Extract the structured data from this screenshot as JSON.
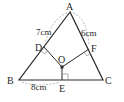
{
  "diagram": {
    "type": "geometry",
    "colors": {
      "line": "#2a2a2a",
      "dash": "#8a8a8a",
      "background": "#ffffff"
    },
    "points": {
      "A": {
        "label": "A",
        "x": 70,
        "y": 12
      },
      "B": {
        "label": "B",
        "x": 19,
        "y": 80
      },
      "C": {
        "label": "C",
        "x": 103,
        "y": 80
      },
      "D": {
        "label": "D",
        "x": 44,
        "y": 47
      },
      "E": {
        "label": "E",
        "x": 62,
        "y": 80
      },
      "F": {
        "label": "F",
        "x": 89,
        "y": 49
      },
      "O": {
        "label": "O",
        "x": 62,
        "y": 67
      }
    },
    "measurements": {
      "AD": "7cm",
      "AF": "6cm",
      "BE": "8cm"
    },
    "right_angles": [
      "ODA-side",
      "OFC-side",
      "OEC"
    ]
  }
}
